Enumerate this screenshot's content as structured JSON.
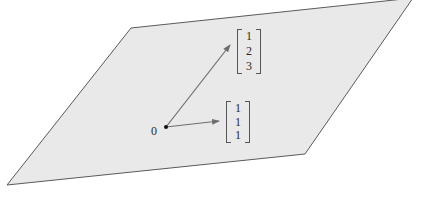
{
  "figure": {
    "plane": {
      "fill": "#e9e9e9",
      "stroke": "#5a5a5a",
      "points": [
        [
          131,
          28
        ],
        [
          413,
          -2
        ],
        [
          305,
          154
        ],
        [
          7,
          185
        ]
      ]
    },
    "origin": {
      "label": "0",
      "x": 166,
      "y": 127
    },
    "vectors": [
      {
        "name": "v1",
        "components": [
          "1",
          "2",
          "3"
        ],
        "tip": [
          230,
          45
        ],
        "color": "#6e6e6e"
      },
      {
        "name": "v2",
        "components": [
          "1",
          "1",
          "1"
        ],
        "tip": [
          219,
          121
        ],
        "color": "#6e6e6e"
      }
    ]
  }
}
